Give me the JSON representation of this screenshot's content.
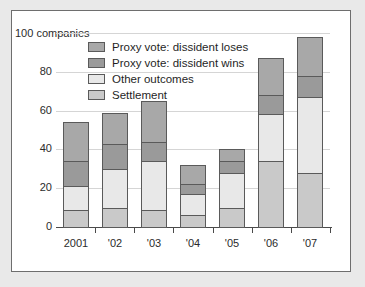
{
  "chart_data": {
    "type": "bar",
    "stacked": true,
    "title": "",
    "subtitle": "",
    "xlabel": "",
    "ylabel": "",
    "y_axis_note": "100 companies",
    "categories": [
      "2001",
      "'02",
      "'03",
      "'04",
      "'05",
      "'06",
      "'07"
    ],
    "ylim": [
      0,
      100
    ],
    "yticks": [
      0,
      20,
      40,
      60,
      80,
      100
    ],
    "ytick_labels": [
      "0",
      "20",
      "40",
      "60",
      "80",
      "100 companies"
    ],
    "grid": true,
    "grid_axis": "y",
    "legend_position": "top-left-inside",
    "series": [
      {
        "name": "Settlement",
        "color": "#c9c9c9",
        "values": [
          9,
          10,
          9,
          6,
          10,
          34,
          28
        ]
      },
      {
        "name": "Other outcomes",
        "color": "#e8e8e8",
        "values": [
          12,
          20,
          25,
          11,
          18,
          24,
          39
        ]
      },
      {
        "name": "Proxy vote: dissident wins",
        "color": "#9a9a9a",
        "values": [
          13,
          13,
          10,
          5,
          6,
          10,
          11
        ]
      },
      {
        "name": "Proxy vote: dissident loses",
        "color": "#a8a8a8",
        "values": [
          20,
          16,
          21,
          10,
          6,
          19,
          20
        ]
      }
    ],
    "cumulative_tops": {
      "2001": [
        9,
        21,
        34,
        54
      ],
      "'02": [
        10,
        30,
        43,
        59
      ],
      "'03": [
        9,
        34,
        44,
        65
      ],
      "'04": [
        6,
        17,
        22,
        32
      ],
      "'05": [
        10,
        28,
        34,
        40
      ],
      "'06": [
        34,
        58,
        68,
        87
      ],
      "'07": [
        28,
        67,
        78,
        98
      ]
    },
    "totals": [
      54,
      59,
      65,
      32,
      40,
      87,
      98
    ]
  },
  "legend": {
    "entries": [
      {
        "label": "Proxy vote: dissident loses",
        "color": "#a8a8a8"
      },
      {
        "label": "Proxy vote: dissident wins",
        "color": "#9a9a9a"
      },
      {
        "label": "Other outcomes",
        "color": "#e8e8e8"
      },
      {
        "label": "Settlement",
        "color": "#c9c9c9"
      }
    ]
  },
  "colors": {
    "page_background": "#e9e9e9",
    "panel_background": "#ffffff",
    "panel_border": "#6e6e6e",
    "axis": "#4a4a4a",
    "gridline": "#d5d5d5",
    "text": "#1f1f1f",
    "bar_outline": "#5a5a5a"
  }
}
